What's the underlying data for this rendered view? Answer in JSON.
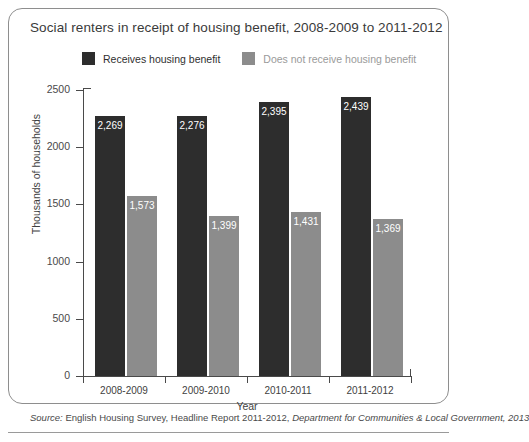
{
  "chart_data": {
    "type": "bar",
    "title": "Social renters in receipt of housing benefit, 2008-2009 to 2011-2012",
    "xlabel": "Year",
    "ylabel": "Thousands of households",
    "categories": [
      "2008-2009",
      "2009-2010",
      "2010-2011",
      "2011-2012"
    ],
    "series": [
      {
        "name": "Receives housing benefit",
        "color": "#2d2d2d",
        "values": [
          2269,
          2276,
          2395,
          2439
        ],
        "labels": [
          "2,269",
          "2,276",
          "2,395",
          "2,439"
        ]
      },
      {
        "name": "Does not receive housing benefit",
        "color": "#8c8c8c",
        "values": [
          1573,
          1399,
          1431,
          1369
        ],
        "labels": [
          "1,573",
          "1,399",
          "1,431",
          "1,369"
        ]
      }
    ],
    "ylim": [
      0,
      2500
    ],
    "yticks": [
      0,
      500,
      1000,
      1500,
      2000,
      2500
    ],
    "ytick_labels": [
      "0",
      "500",
      "1000",
      "1500",
      "2000",
      "2500"
    ],
    "grid": false,
    "legend_position": "top"
  },
  "source": {
    "prefix": "Source:",
    "main": " English Housing Survey, Headline Report 2011-2012, ",
    "emphasis": "Department for Communities & Local Government, 2013"
  }
}
